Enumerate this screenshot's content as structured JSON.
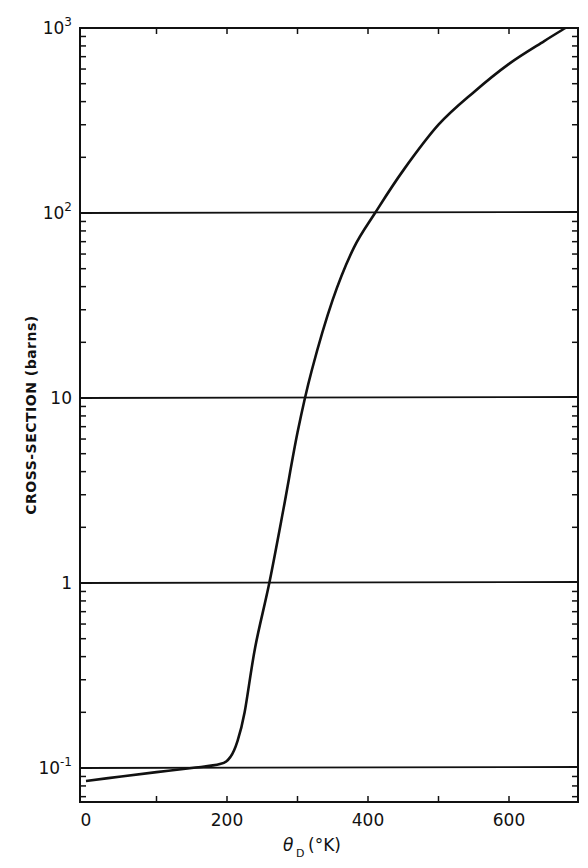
{
  "chart_data": {
    "type": "line",
    "title": "",
    "xlabel": "θD (°K)",
    "xlabel_symbol": "θ",
    "xlabel_subscript": "D",
    "xlabel_unit": "(°K)",
    "ylabel": "CROSS-SECTION (barns)",
    "yscale": "log",
    "xlim": [
      0,
      700
    ],
    "ylim": [
      0.065,
      1000
    ],
    "x_ticks": [
      0,
      200,
      400,
      600
    ],
    "x_tick_labels": [
      "0",
      "200",
      "400",
      "600"
    ],
    "y_ticks": [
      0.1,
      1,
      10,
      100,
      1000
    ],
    "y_tick_labels": [
      {
        "base": "10",
        "exp": "-1"
      },
      {
        "base": "1",
        "exp": ""
      },
      {
        "base": "10",
        "exp": ""
      },
      {
        "base": "10",
        "exp": "2"
      },
      {
        "base": "10",
        "exp": "3"
      }
    ],
    "grid": {
      "horizontal_at_decades": true,
      "vertical": false
    },
    "legend": null,
    "series": [
      {
        "name": "cross-section",
        "x": [
          0,
          50,
          100,
          150,
          190,
          205,
          215,
          225,
          240,
          260,
          280,
          300,
          320,
          350,
          380,
          410,
          450,
          500,
          550,
          600,
          650,
          680
        ],
        "y": [
          0.085,
          0.09,
          0.095,
          0.1,
          0.105,
          0.115,
          0.14,
          0.2,
          0.45,
          1.0,
          2.5,
          6.5,
          14,
          34,
          65,
          100,
          170,
          300,
          450,
          640,
          850,
          1000
        ]
      }
    ],
    "reference_lines": [
      {
        "name": "horizontal line at 0.1",
        "y": 0.1
      },
      {
        "name": "horizontal line at 1",
        "y": 1
      },
      {
        "name": "horizontal line at 10",
        "y": 10
      },
      {
        "name": "horizontal line at 100",
        "y": 100
      }
    ]
  }
}
